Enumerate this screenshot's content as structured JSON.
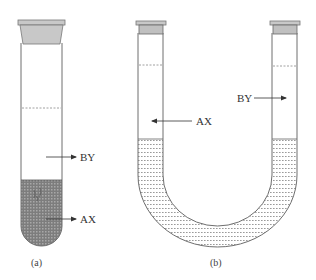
{
  "figure": {
    "panels": [
      {
        "id": "a",
        "caption": "(a)",
        "description": "Single stoppered test tube with two layers",
        "labels": {
          "upper": "BY",
          "lower": "AX"
        }
      },
      {
        "id": "b",
        "caption": "(b)",
        "description": "Stoppered U-tube with liquid in the bend",
        "labels": {
          "left": "AX",
          "right": "BY"
        }
      }
    ]
  },
  "colors": {
    "outline": "#6e6e6e",
    "stopper_fill": "#c8c8c8",
    "dense_fill": "#8a8a8a",
    "light_hatch": "#9a9a9a",
    "dashed_line": "#888888",
    "text": "#333333"
  }
}
